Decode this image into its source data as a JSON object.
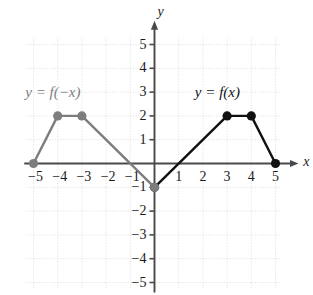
{
  "chart_data": {
    "type": "line",
    "title": "",
    "xlabel": "x",
    "ylabel": "y",
    "xlim": [
      -5.6,
      5.6
    ],
    "ylim": [
      -5.4,
      5.4
    ],
    "grid": true,
    "grid_style": "dotted",
    "grid_color": "#d8d8d8",
    "axis_color": "#4a4a4a",
    "legend": "inline-annotations",
    "x_ticks": [
      "-5",
      "-4",
      "-3",
      "-2",
      "-1",
      "1",
      "2",
      "3",
      "4",
      "5"
    ],
    "x_tick_values": [
      -5,
      -4,
      -3,
      -2,
      -1,
      1,
      2,
      3,
      4,
      5
    ],
    "y_ticks": [
      "5",
      "4",
      "3",
      "2",
      "1",
      "-1",
      "-2",
      "-3",
      "-4",
      "-5"
    ],
    "y_tick_values": [
      5,
      4,
      3,
      2,
      1,
      -1,
      -2,
      -3,
      -4,
      -5
    ],
    "series": [
      {
        "name": "y = f(x)",
        "color": "#111111",
        "points": [
          [
            0,
            -1
          ],
          [
            3,
            2
          ],
          [
            4,
            2
          ],
          [
            5,
            0
          ]
        ],
        "markers": [
          [
            0,
            -1
          ],
          [
            3,
            2
          ],
          [
            4,
            2
          ],
          [
            5,
            0
          ]
        ],
        "label": "y = f(x)",
        "label_x": 2.6,
        "label_y": 3.0
      },
      {
        "name": "y = f(-x)",
        "color": "#7d7d7d",
        "points": [
          [
            -5,
            0
          ],
          [
            -4,
            2
          ],
          [
            -3,
            2
          ],
          [
            0,
            -1
          ]
        ],
        "markers": [
          [
            -5,
            0
          ],
          [
            -4,
            2
          ],
          [
            -3,
            2
          ],
          [
            0,
            -1
          ]
        ],
        "label": "y = f(−x)",
        "label_x": -4.2,
        "label_y": 3.0
      }
    ]
  },
  "axes": {
    "x_axis_label": "x",
    "y_axis_label": "y"
  },
  "labels": {
    "reflected_curve": "y = f(−x)",
    "original_curve": "y = f(x)"
  },
  "ticks": {
    "x": [
      {
        "text": "−5",
        "value": -5
      },
      {
        "text": "−4",
        "value": -4
      },
      {
        "text": "−3",
        "value": -3
      },
      {
        "text": "−2",
        "value": -2
      },
      {
        "text": "−1",
        "value": -1
      },
      {
        "text": "1",
        "value": 1
      },
      {
        "text": "2",
        "value": 2
      },
      {
        "text": "3",
        "value": 3
      },
      {
        "text": "4",
        "value": 4
      },
      {
        "text": "5",
        "value": 5
      }
    ],
    "y": [
      {
        "text": "5",
        "value": 5
      },
      {
        "text": "4",
        "value": 4
      },
      {
        "text": "3",
        "value": 3
      },
      {
        "text": "2",
        "value": 2
      },
      {
        "text": "1",
        "value": 1
      },
      {
        "text": "−1",
        "value": -1
      },
      {
        "text": "−2",
        "value": -2
      },
      {
        "text": "−3",
        "value": -3
      },
      {
        "text": "−4",
        "value": -4
      },
      {
        "text": "−5",
        "value": -5
      }
    ]
  },
  "colors": {
    "black_curve": "#111111",
    "gray_curve": "#7d7d7d",
    "axis": "#4a4a4a",
    "grid": "#dcdcdc",
    "background": "#ffffff"
  }
}
